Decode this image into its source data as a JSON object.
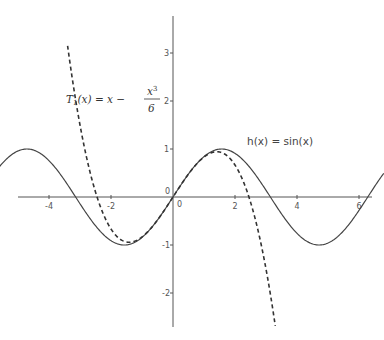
{
  "chart_data": {
    "type": "line",
    "title": "",
    "xlabel": "",
    "ylabel": "",
    "xlim": [
      -5.6,
      6.8
    ],
    "ylim": [
      -2.7,
      3.8
    ],
    "grid": false,
    "x_ticks": [
      -4,
      -2,
      0,
      2,
      4,
      6
    ],
    "x_tick_labels": [
      "-4",
      "-2",
      "0",
      "2",
      "4",
      "6"
    ],
    "y_ticks": [
      -2,
      -1,
      0,
      1,
      2,
      3
    ],
    "y_tick_labels": [
      "-2",
      "-1",
      "0",
      "1",
      "2",
      "3"
    ],
    "origin_labels": [
      "0",
      "0"
    ],
    "series": [
      {
        "name": "h(x) = sin(x)",
        "style": "solid",
        "color": "#444444",
        "function": "sin(x)",
        "x_range": [
          -5.6,
          6.8
        ]
      },
      {
        "name": "T1(x) = x - x^3/6",
        "style": "dashed",
        "color": "#333333",
        "function": "x - x^3/6",
        "x_range": [
          -3.4,
          3.35
        ]
      }
    ],
    "annotations": [
      {
        "id": "taylor",
        "text_prefix": "T",
        "text_sub": "1",
        "text_mid": "(x) = x − ",
        "frac_num": "x",
        "frac_num_sup": "3",
        "frac_den": "6"
      },
      {
        "id": "sine",
        "text": "h(x) = sin(x)"
      }
    ]
  }
}
